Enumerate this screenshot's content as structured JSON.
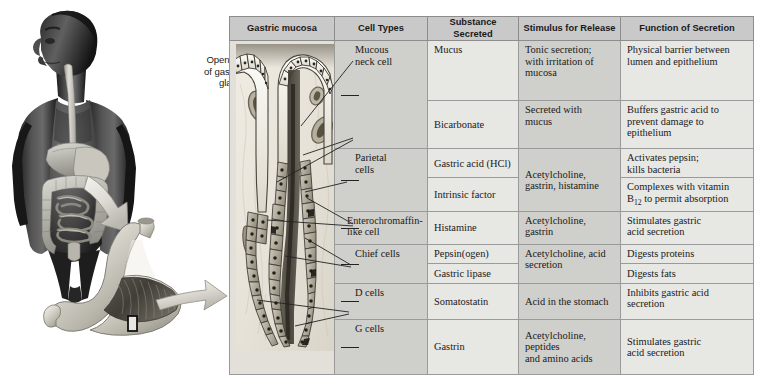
{
  "figure": {
    "left_illustration": {
      "name": "human-torso-and-stomach-illustration",
      "parts": [
        "human-torso",
        "digestive-organs",
        "esophagus",
        "liver",
        "stomach",
        "small-intestine",
        "large-intestine",
        "magnification-arrow-1",
        "stomach-detail",
        "rugae",
        "magnification-arrow-2",
        "sample-region-box"
      ]
    },
    "callout": {
      "label_line1": "Opening",
      "label_line2": "of gastric",
      "label_line3": "gland"
    }
  },
  "table": {
    "headers": [
      "Gastric mucosa",
      "Cell Types",
      "Substance Secreted",
      "Stimulus for Release",
      "Function of Secretion"
    ],
    "cell_types": [
      {
        "label_line1": "Mucous",
        "label_line2": "neck cell",
        "rowspan": 2
      },
      {
        "label_line1": "Parietal",
        "label_line2": "cells",
        "rowspan": 2
      },
      {
        "label_line1": "Enterochromaffin-",
        "label_line2": "like cell",
        "rowspan": 1
      },
      {
        "label_line1": "Chief cells",
        "label_line2": "",
        "rowspan": 2
      },
      {
        "label_line1": "D cells",
        "label_line2": "",
        "rowspan": 1
      },
      {
        "label_line1": "G cells",
        "label_line2": "",
        "rowspan": 1
      }
    ],
    "rows": [
      {
        "substance": "Mucus",
        "stimulus": "Tonic secretion;\nwith irritation of\nmucosa",
        "function": "Physical barrier between\nlumen  and epithelium"
      },
      {
        "substance": "Bicarbonate",
        "stimulus": "Secreted with\nmucus",
        "function": "Buffers gastric acid to\nprevent damage to\nepithelium"
      },
      {
        "substance": "Gastric acid (HCl)",
        "stimulus": "Acetylcholine,\ngastrin, histamine",
        "stimulus_rowspan": 2,
        "function": "Activates pepsin;\nkills bacteria"
      },
      {
        "substance": "Intrinsic factor",
        "function_html": "Complexes with vitamin\nB12 to permit absorption",
        "function_sub": "12"
      },
      {
        "substance": "Histamine",
        "stimulus": "Acetylcholine,\ngastrin",
        "function": "Stimulates gastric\nacid secretion"
      },
      {
        "substance": "Pepsin(ogen)",
        "stimulus": "Acetylcholine, acid\nsecretion",
        "stimulus_rowspan": 2,
        "function": "Digests proteins"
      },
      {
        "substance": "Gastric lipase",
        "function": "Digests fats"
      },
      {
        "substance": "Somatostatin",
        "stimulus": "Acid in the stomach",
        "function": "Inhibits gastric acid\nsecretion"
      },
      {
        "substance": "Gastrin",
        "stimulus": "Acetylcholine,\npeptides\nand amino acids",
        "function": "Stimulates gastric\nacid secretion"
      }
    ]
  },
  "colors": {
    "header_bg": "#c9c9c9",
    "col_light": "#e7e7e4",
    "col_dark": "#cfcfcb",
    "border": "#9a9a9a",
    "text": "#1a1a1a",
    "histology_bg": "#e3e0da"
  }
}
